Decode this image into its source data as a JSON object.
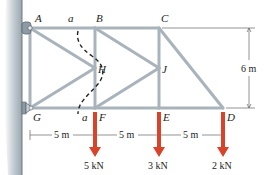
{
  "diagram": {
    "type": "truss",
    "joints": [
      {
        "id": "A",
        "label": "A",
        "x": 30,
        "y": 28
      },
      {
        "id": "B",
        "label": "B",
        "x": 95,
        "y": 28
      },
      {
        "id": "C",
        "label": "C",
        "x": 159,
        "y": 28
      },
      {
        "id": "G",
        "label": "G",
        "x": 30,
        "y": 108
      },
      {
        "id": "F",
        "label": "F",
        "x": 95,
        "y": 108
      },
      {
        "id": "E",
        "label": "E",
        "x": 159,
        "y": 108
      },
      {
        "id": "D",
        "label": "D",
        "x": 223,
        "y": 108
      },
      {
        "id": "H",
        "label": "H",
        "x": 95,
        "y": 68
      },
      {
        "id": "J",
        "label": "J",
        "x": 159,
        "y": 68
      }
    ],
    "section_labels": {
      "top": "a",
      "bottom": "a"
    },
    "dimensions": {
      "height": "6 m",
      "spans": [
        "5 m",
        "5 m",
        "5 m"
      ]
    },
    "loads": [
      {
        "joint": "F",
        "label": "5 kN"
      },
      {
        "joint": "E",
        "label": "3 kN"
      },
      {
        "joint": "D",
        "label": "2 kN"
      }
    ],
    "colors": {
      "member": "#a9b3bb",
      "load_arrow": "#d9432b",
      "wall": "#b9c3cb",
      "section_line": "#222222"
    }
  }
}
